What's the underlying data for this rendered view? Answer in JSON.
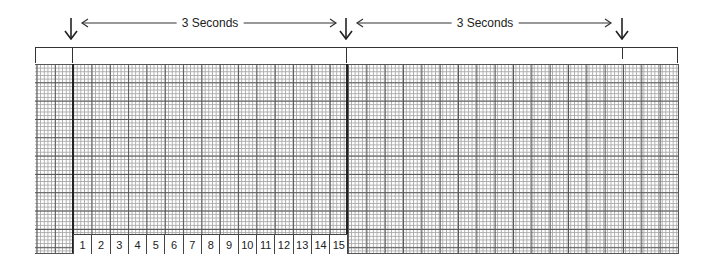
{
  "diagram": {
    "type": "ecg-paper-timing-strip",
    "intervals": [
      {
        "label": "3 Seconds",
        "start_x": 73,
        "end_x": 347
      },
      {
        "label": "3 Seconds",
        "start_x": 347,
        "end_x": 622
      }
    ],
    "markers": [
      {
        "name": "marker-1",
        "x": 73
      },
      {
        "name": "marker-2",
        "x": 347
      },
      {
        "name": "marker-3",
        "x": 622
      }
    ],
    "grid": {
      "small_square_px": 3.667,
      "large_square_px": 18.33,
      "small_per_large": 5,
      "minor_line_color": "#aaaaaa",
      "major_line_color": "#555555"
    },
    "count_strip": {
      "cells": [
        "1",
        "2",
        "3",
        "4",
        "5",
        "6",
        "7",
        "8",
        "9",
        "10",
        "11",
        "12",
        "13",
        "14",
        "15"
      ]
    }
  }
}
